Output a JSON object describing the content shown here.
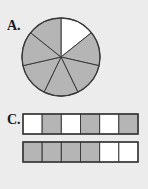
{
  "figure": {
    "part_a": {
      "label": "A.",
      "shape": "circle",
      "total_parts": 7,
      "shaded_parts": 6,
      "unshaded_parts": 1,
      "slices": [
        "white",
        "gray",
        "gray",
        "gray",
        "gray",
        "gray",
        "gray"
      ]
    },
    "part_c": {
      "label": "C.",
      "bars": [
        {
          "cells": [
            "white",
            "gray",
            "white",
            "gray",
            "white",
            "gray"
          ],
          "shaded_parts": 3,
          "total_parts": 6
        },
        {
          "cells": [
            "gray",
            "gray",
            "gray",
            "gray",
            "white",
            "white"
          ],
          "shaded_parts": 4,
          "total_parts": 6
        }
      ]
    }
  },
  "colors": {
    "background": "#ececec",
    "shaded": "#b5b5b5",
    "unshaded": "#ffffff",
    "stroke": "#3a3a3a"
  }
}
